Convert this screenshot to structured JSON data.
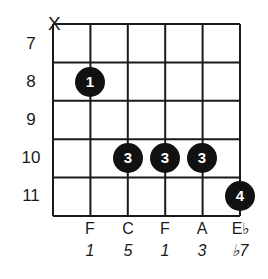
{
  "chord_diagram": {
    "muted_strings": [
      {
        "string": 1,
        "symbol": "X"
      }
    ],
    "fret_numbers": [
      "7",
      "8",
      "9",
      "10",
      "11"
    ],
    "strings": 6,
    "frets": 5,
    "fingerings": [
      {
        "string": 2,
        "fret": 8,
        "finger": "1"
      },
      {
        "string": 3,
        "fret": 10,
        "finger": "3"
      },
      {
        "string": 4,
        "fret": 10,
        "finger": "3"
      },
      {
        "string": 5,
        "fret": 10,
        "finger": "3"
      },
      {
        "string": 6,
        "fret": 11,
        "finger": "4"
      }
    ],
    "note_names": [
      "F",
      "C",
      "F",
      "A",
      "E♭"
    ],
    "intervals": [
      "1",
      "5",
      "1",
      "3",
      "♭7"
    ],
    "colors": {
      "line": "#1a1a1a",
      "dot": "#111111",
      "dot_text": "#ffffff",
      "background": "#ffffff"
    }
  }
}
